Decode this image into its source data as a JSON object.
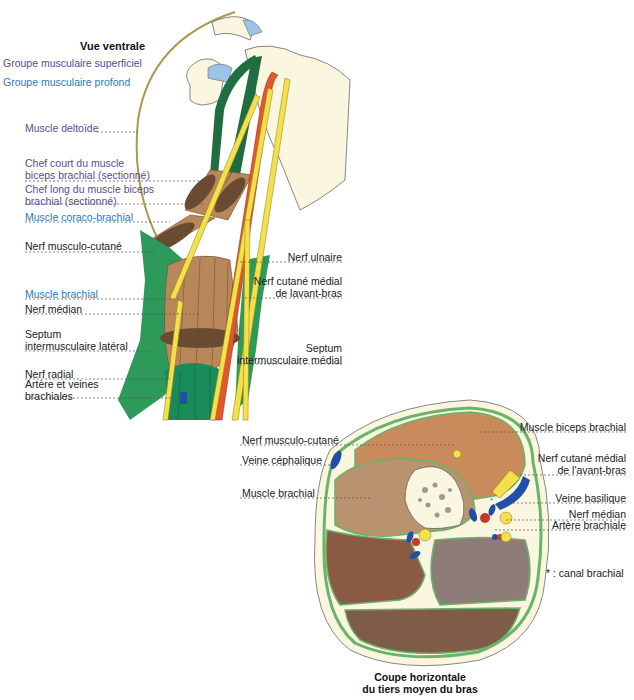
{
  "figure_top": {
    "title": "Vue ventrale",
    "legend": [
      {
        "label": "Groupe musculaire superficiel",
        "color": "#5b4a8e"
      },
      {
        "label": "Groupe musculaire profond",
        "color": "#2d79b8"
      }
    ],
    "left_labels": [
      {
        "text": "Muscle deltoïde",
        "style": "purple"
      },
      {
        "text": "Chef court du muscle",
        "text2": "biceps brachial (sectionné)",
        "style": "purple"
      },
      {
        "text": "Chef long du muscle biceps",
        "text2": "brachial (sectionné)",
        "style": "purple"
      },
      {
        "text": "Muscle coraco-brachial",
        "style": "blue"
      },
      {
        "text": "Nerf musculo-cutané",
        "style": "black"
      },
      {
        "text": "Muscle brachial",
        "style": "blue"
      },
      {
        "text": "Nerf médian",
        "style": "black"
      },
      {
        "text": "Septum",
        "text2": "intermusculaire latéral",
        "style": "black"
      },
      {
        "text": "Nerf radial",
        "style": "black"
      },
      {
        "text": "Artère et veines",
        "text2": "brachiales",
        "style": "black"
      }
    ],
    "right_labels": [
      {
        "text": "Nerf ulnaire"
      },
      {
        "text": "Nerf cutané médial",
        "text2": "de lavant-bras"
      },
      {
        "text": "Septum",
        "text2": "intermusculaire médial"
      }
    ]
  },
  "figure_bottom": {
    "left_labels": [
      {
        "text": "Nerf musculo-cutané"
      },
      {
        "text": "Veine céphalique"
      },
      {
        "text": "Muscle brachial"
      }
    ],
    "right_labels": [
      {
        "text": "Muscle biceps brachial"
      },
      {
        "text": "Nerf cutané médial",
        "text2": "de l'avant-bras"
      },
      {
        "text": "Veine basilique"
      },
      {
        "text": "Nerf médian"
      },
      {
        "text": "Artère brachiale"
      }
    ],
    "note": "* : canal brachial",
    "caption_line1": "Coupe horizontale",
    "caption_line2": "du tiers moyen du bras"
  },
  "colors": {
    "muscle_green": "#2e9a5a",
    "dark_green": "#1f6e42",
    "muscle_brown": "#b8875a",
    "dark_brown": "#6b4a32",
    "artery_red": "#e4572e",
    "nerve_yellow": "#f4e04d",
    "vein_blue": "#1f4fa8",
    "bone": "#fbf6e0",
    "biceps": "#c98a5c",
    "brachial": "#b99270",
    "posterior1": "#8a5a44",
    "posterior2": "#8d7c78",
    "posterior3": "#7e5c48",
    "septum_green": "#6ab46a"
  }
}
